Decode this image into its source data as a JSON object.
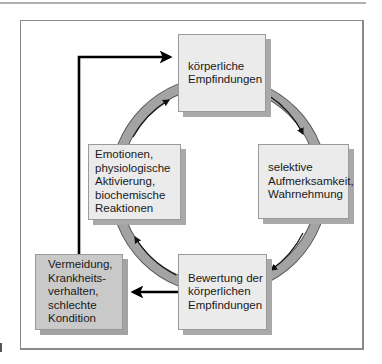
{
  "diagram": {
    "type": "cycle",
    "colors": {
      "box_light": "#ebebeb",
      "box_dark": "#c9c9c9",
      "ring": "#9e9e9e",
      "arrow": "#000000"
    },
    "nodes": [
      {
        "id": "koerperliche-empfindungen",
        "lines": [
          "körperliche",
          "Empfindungen"
        ]
      },
      {
        "id": "selektive-aufmerksamkeit",
        "lines": [
          "selektive",
          "Aufmerksamkeit,",
          "Wahrnehmung"
        ]
      },
      {
        "id": "bewertung",
        "lines": [
          "Bewertung der",
          "körperlichen",
          "Empfindungen"
        ]
      },
      {
        "id": "emotionen",
        "lines": [
          "Emotionen,",
          "physiologische",
          "Aktivierung,",
          "biochemische",
          "Reaktionen"
        ]
      },
      {
        "id": "vermeidung",
        "lines": [
          "Vermeidung,",
          "Krankheits-",
          "verhalten,",
          "schlechte",
          "Kondition"
        ]
      }
    ],
    "edges": [
      {
        "from": "koerperliche-empfindungen",
        "to": "selektive-aufmerksamkeit",
        "style": "ring"
      },
      {
        "from": "selektive-aufmerksamkeit",
        "to": "bewertung",
        "style": "ring"
      },
      {
        "from": "bewertung",
        "to": "emotionen",
        "style": "ring"
      },
      {
        "from": "emotionen",
        "to": "koerperliche-empfindungen",
        "style": "ring"
      },
      {
        "from": "bewertung",
        "to": "vermeidung",
        "style": "bold-arrow"
      },
      {
        "from": "vermeidung",
        "to": "koerperliche-empfindungen",
        "style": "bold-arrow"
      }
    ]
  }
}
